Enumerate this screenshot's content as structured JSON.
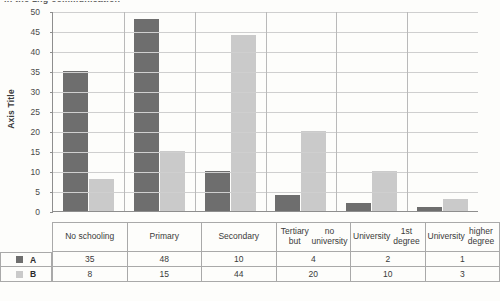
{
  "page": {
    "cut_off_text": "in the 1ng communication"
  },
  "chart_data": {
    "type": "bar",
    "title": "",
    "subtitle": "",
    "xlabel": "",
    "ylabel": "Axis Title",
    "ylim": [
      0,
      50
    ],
    "ytick_step": 5,
    "yticks": [
      "50",
      "45",
      "40",
      "35",
      "30",
      "25",
      "20",
      "15",
      "10",
      "5",
      "0"
    ],
    "grid": true,
    "legend_position": "table-left",
    "categories": [
      "No schooling",
      "Primary",
      "Secondary",
      "Tertiary but no university",
      "University 1st degree",
      "University higher degree"
    ],
    "category_lines": [
      [
        "No schooling"
      ],
      [
        "Primary"
      ],
      [
        "Secondary"
      ],
      [
        "Tertiary but",
        "no university"
      ],
      [
        "University",
        "1st degree"
      ],
      [
        "University",
        "higher degree"
      ]
    ],
    "series": [
      {
        "name": "A",
        "color": "#6e6e6e",
        "values": [
          35,
          48,
          10,
          4,
          2,
          1
        ]
      },
      {
        "name": "B",
        "color": "#cacaca",
        "values": [
          8,
          15,
          44,
          20,
          10,
          3
        ]
      }
    ]
  },
  "table": {
    "rows": [
      {
        "key": "A",
        "swatch": "#6e6e6e",
        "values": [
          "35",
          "48",
          "10",
          "4",
          "2",
          "1"
        ]
      },
      {
        "key": "B",
        "swatch": "#cacaca",
        "values": [
          "8",
          "15",
          "44",
          "20",
          "10",
          "3"
        ]
      }
    ]
  },
  "colors": {
    "series_a": "#6e6e6e",
    "series_b": "#cacaca",
    "gridline": "#cfcfcf",
    "axis": "#8e8e8e",
    "table_border": "#a9a9a9",
    "background": "#fdfdfb"
  }
}
